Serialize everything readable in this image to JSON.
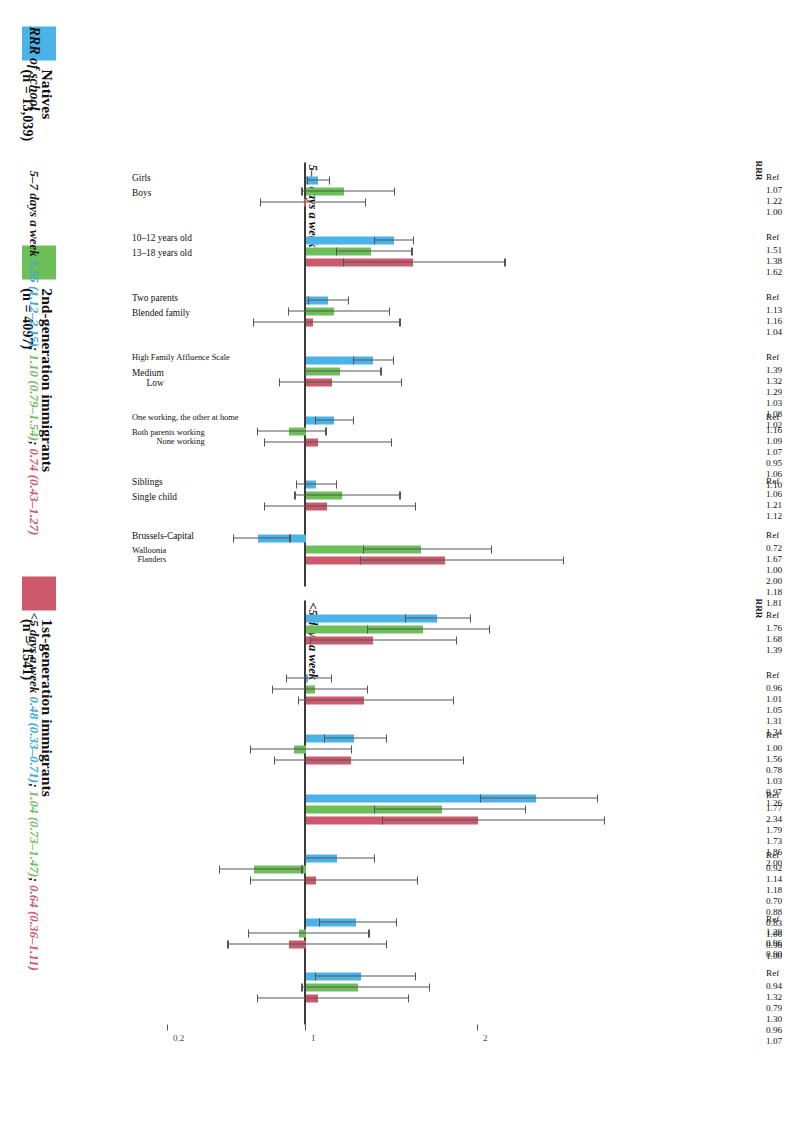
{
  "figure": {
    "caption_main": "RRR of school",
    "colors": {
      "natives": "#4cb3e8",
      "gen2": "#6cbf59",
      "gen1": "#cc5a6c",
      "axis": "#3b3b3b",
      "whisker": "#555555"
    }
  },
  "legend": {
    "items": [
      {
        "label": "Natives",
        "n": "(n = 13,039)",
        "color_key": "natives",
        "swatch": "#4cb3e8"
      },
      {
        "label": "2nd-generation immigrants",
        "n": "(n = 4097)",
        "color_key": "gen2",
        "swatch": "#6cbf59"
      },
      {
        "label": "1st-generation immigrants",
        "n": "(n = 1541)",
        "color_key": "gen1",
        "swatch": "#cc5a6c"
      }
    ]
  },
  "panels": [
    {
      "id": "A",
      "title": "5–7 days a week",
      "rrr_header": "RRR"
    },
    {
      "id": "B",
      "title": "<5 days a week",
      "rrr_header": "RRR"
    }
  ],
  "axis": {
    "ticks": [
      "0.2",
      "1",
      "2"
    ],
    "tick_values": [
      0.2,
      1,
      2
    ]
  },
  "categories": [
    {
      "label": "Girls",
      "group": "sex"
    },
    {
      "label": "Boys",
      "group": "sex"
    },
    {
      "label": "Boys",
      "group": "sex"
    },
    {
      "label": "Boys",
      "group": "sex"
    },
    {
      "label": "10–12 years old",
      "group": "age"
    },
    {
      "label": "13–18 years old",
      "group": "age"
    },
    {
      "label": "13–18 years old",
      "group": "age"
    },
    {
      "label": "13–18 years old",
      "group": "age"
    },
    {
      "label": "Two parents",
      "group": "family"
    },
    {
      "label": "Blended family\nSingle-parent family",
      "group": "family"
    },
    {
      "label": "Blended family\nSingle-parent family",
      "group": "family"
    },
    {
      "label": "Blended family\nSingle-parent family",
      "group": "family"
    },
    {
      "label": "High Family Affluence Scale",
      "group": "fas"
    },
    {
      "label": "Medium\nLow",
      "group": "fas"
    },
    {
      "label": "Medium\nLow",
      "group": "fas"
    },
    {
      "label": "Medium\nLow",
      "group": "fas"
    },
    {
      "label": "One working, the other at home",
      "group": "work"
    },
    {
      "label": "Both parents working\nOne working, the other not at home\nNone working",
      "group": "work"
    },
    {
      "label": "Both parents working\nOne working, the other not at home\nNone working",
      "group": "work"
    },
    {
      "label": "Both parents working\nOne working, the other not at home\nNone working",
      "group": "work"
    },
    {
      "label": "Siblings",
      "group": "sib"
    },
    {
      "label": "Single child",
      "group": "sib"
    },
    {
      "label": "Single child",
      "group": "sib"
    },
    {
      "label": "Single child",
      "group": "sib"
    },
    {
      "label": "Brussels-Capital",
      "group": "region"
    },
    {
      "label": "Walloonia\nFlanders",
      "group": "region"
    },
    {
      "label": "Walloonia\nFlanders",
      "group": "region"
    },
    {
      "label": "Walloonia\nFlanders",
      "group": "region"
    }
  ],
  "chart_data": {
    "type": "bar",
    "title": "RRR of school",
    "xlabel": "",
    "ylabel": "RRR",
    "ylim": [
      0.2,
      2.6
    ],
    "grid": false,
    "legend_position": "bottom-left",
    "reference_line": 1.0,
    "series_names": [
      "Natives",
      "2nd-generation immigrants",
      "1st-generation immigrants"
    ],
    "series_colors": [
      "#4cb3e8",
      "#6cbf59",
      "#cc5a6c"
    ],
    "panels": [
      {
        "name": "5–7 days a week",
        "groups": [
          {
            "name": "Sex",
            "reference": "Girls",
            "rows": [
              {
                "label": "Boys",
                "values": [
                  1.07,
                  1.22,
                  1.0
                ],
                "rrr_text": [
                  "Ref",
                  "1.07",
                  "1.22",
                  "1.00"
                ],
                "bars": [
                  {
                    "s": "natives",
                    "est": 1.07,
                    "lo": 1.01,
                    "hi": 1.14
                  },
                  {
                    "s": "gen2",
                    "est": 1.22,
                    "lo": 0.98,
                    "hi": 1.52
                  },
                  {
                    "s": "gen1",
                    "est": 1.0,
                    "lo": 0.74,
                    "hi": 1.35
                  }
                ]
              }
            ]
          },
          {
            "name": "Age",
            "reference": "10–12 years old",
            "rows": [
              {
                "label": "13–18 years old",
                "rrr_text": [
                  "Ref",
                  "1.51",
                  "1.38",
                  "1.62"
                ],
                "bars": [
                  {
                    "s": "natives",
                    "est": 1.51,
                    "lo": 1.4,
                    "hi": 1.63
                  },
                  {
                    "s": "gen2",
                    "est": 1.38,
                    "lo": 1.18,
                    "hi": 1.62
                  },
                  {
                    "s": "gen1",
                    "est": 1.62,
                    "lo": 1.22,
                    "hi": 2.16
                  }
                ]
              }
            ]
          },
          {
            "name": "Family structure",
            "reference": "Two parents",
            "rows": [
              {
                "label": "Blended family",
                "rrr_text": [
                  "Ref",
                  "1.13",
                  "1.16",
                  "1.04"
                ],
                "bars": [
                  {
                    "s": "natives",
                    "est": 1.13,
                    "lo": 1.02,
                    "hi": 1.25
                  },
                  {
                    "s": "gen2",
                    "est": 1.16,
                    "lo": 0.9,
                    "hi": 1.49
                  },
                  {
                    "s": "gen1",
                    "est": 1.04,
                    "lo": 0.7,
                    "hi": 1.55
                  }
                ]
              }
            ]
          },
          {
            "name": "Family Affluence Scale",
            "reference": "High Family Affluence Scale",
            "rows": [
              {
                "label": "Medium / Low",
                "rrr_text": [
                  "Ref",
                  "1.39",
                  "1.32",
                  "1.29",
                  "1.03",
                  "1.08",
                  "1.02"
                ],
                "bars": [
                  {
                    "s": "natives",
                    "est": 1.39,
                    "lo": 1.28,
                    "hi": 1.51
                  },
                  {
                    "s": "gen2",
                    "est": 1.2,
                    "lo": 1.0,
                    "hi": 1.44
                  },
                  {
                    "s": "gen1",
                    "est": 1.15,
                    "lo": 0.85,
                    "hi": 1.56
                  }
                ]
              }
            ]
          },
          {
            "name": "Parental work",
            "reference": "One working, the other at home",
            "rows": [
              {
                "label": "Both parents working / None working",
                "rrr_text": [
                  "Ref",
                  "1.16",
                  "1.09",
                  "1.07",
                  "0.95",
                  "1.06",
                  "1.10"
                ],
                "bars": [
                  {
                    "s": "natives",
                    "est": 1.16,
                    "lo": 1.06,
                    "hi": 1.28
                  },
                  {
                    "s": "gen2",
                    "est": 0.9,
                    "lo": 0.72,
                    "hi": 1.12
                  },
                  {
                    "s": "gen1",
                    "est": 1.07,
                    "lo": 0.76,
                    "hi": 1.5
                  }
                ]
              }
            ]
          },
          {
            "name": "Siblings",
            "reference": "Siblings",
            "rows": [
              {
                "label": "Single child",
                "rrr_text": [
                  "Ref",
                  "1.06",
                  "1.21",
                  "1.12"
                ],
                "bars": [
                  {
                    "s": "natives",
                    "est": 1.06,
                    "lo": 0.95,
                    "hi": 1.18
                  },
                  {
                    "s": "gen2",
                    "est": 1.21,
                    "lo": 0.94,
                    "hi": 1.55
                  },
                  {
                    "s": "gen1",
                    "est": 1.12,
                    "lo": 0.76,
                    "hi": 1.64
                  }
                ]
              }
            ]
          },
          {
            "name": "Region",
            "reference": "Brussels-Capital",
            "rows": [
              {
                "label": "Walloonia / Flanders",
                "rrr_text": [
                  "Ref",
                  "0.72",
                  "1.67",
                  "1.00",
                  "2.00",
                  "1.18",
                  "1.81"
                ],
                "bars": [
                  {
                    "s": "natives",
                    "est": 0.72,
                    "lo": 0.58,
                    "hi": 0.91
                  },
                  {
                    "s": "gen2",
                    "est": 1.67,
                    "lo": 1.34,
                    "hi": 2.08
                  },
                  {
                    "s": "gen1",
                    "est": 1.81,
                    "lo": 1.32,
                    "hi": 2.5
                  }
                ]
              }
            ]
          }
        ]
      },
      {
        "name": "<5 days a week",
        "groups": [
          {
            "name": "Sex",
            "reference": "Girls",
            "rows": [
              {
                "label": "Boys",
                "rrr_text": [
                  "Ref",
                  "1.76",
                  "1.68",
                  "1.39"
                ],
                "bars": [
                  {
                    "s": "natives",
                    "est": 1.76,
                    "lo": 1.58,
                    "hi": 1.96
                  },
                  {
                    "s": "gen2",
                    "est": 1.68,
                    "lo": 1.36,
                    "hi": 2.07
                  },
                  {
                    "s": "gen1",
                    "est": 1.39,
                    "lo": 1.03,
                    "hi": 1.88
                  }
                ]
              }
            ]
          },
          {
            "name": "Age",
            "reference": "10–12 years old",
            "rows": [
              {
                "label": "13–18 years old",
                "rrr_text": [
                  "Ref",
                  "0.96",
                  "1.01",
                  "1.05",
                  "1.31",
                  "1.34"
                ],
                "bars": [
                  {
                    "s": "natives",
                    "est": 1.01,
                    "lo": 0.89,
                    "hi": 1.15
                  },
                  {
                    "s": "gen2",
                    "est": 1.05,
                    "lo": 0.81,
                    "hi": 1.36
                  },
                  {
                    "s": "gen1",
                    "est": 1.34,
                    "lo": 0.96,
                    "hi": 1.86
                  }
                ]
              }
            ]
          },
          {
            "name": "Family structure",
            "reference": "Two parents",
            "rows": [
              {
                "label": "Blended family",
                "rrr_text": [
                  "Ref",
                  "1.00",
                  "1.56",
                  "0.78",
                  "1.03",
                  "0.97",
                  "1.26"
                ],
                "bars": [
                  {
                    "s": "natives",
                    "est": 1.28,
                    "lo": 1.11,
                    "hi": 1.47
                  },
                  {
                    "s": "gen2",
                    "est": 0.93,
                    "lo": 0.68,
                    "hi": 1.27
                  },
                  {
                    "s": "gen1",
                    "est": 1.26,
                    "lo": 0.82,
                    "hi": 1.92
                  }
                ]
              }
            ]
          },
          {
            "name": "Family Affluence Scale",
            "reference": "High Family Affluence Scale",
            "rows": [
              {
                "label": "Medium / Low",
                "rrr_text": [
                  "Ref",
                  "1.77",
                  "2.34",
                  "1.79",
                  "1.73",
                  "1.86",
                  "2.00"
                ],
                "bars": [
                  {
                    "s": "natives",
                    "est": 2.34,
                    "lo": 2.02,
                    "hi": 2.7
                  },
                  {
                    "s": "gen2",
                    "est": 1.79,
                    "lo": 1.4,
                    "hi": 2.28
                  },
                  {
                    "s": "gen1",
                    "est": 2.0,
                    "lo": 1.45,
                    "hi": 2.74
                  }
                ]
              }
            ]
          },
          {
            "name": "Parental work",
            "reference": "One working, the other at home",
            "rows": [
              {
                "label": "Both parents working / None working",
                "rrr_text": [
                  "Ref",
                  "0.92",
                  "1.14",
                  "1.18",
                  "0.70",
                  "0.88",
                  "0.83",
                  "1.06",
                  "0.96",
                  "1.00"
                ],
                "bars": [
                  {
                    "s": "natives",
                    "est": 1.18,
                    "lo": 1.0,
                    "hi": 1.4
                  },
                  {
                    "s": "gen2",
                    "est": 0.7,
                    "lo": 0.5,
                    "hi": 0.98
                  },
                  {
                    "s": "gen1",
                    "est": 1.06,
                    "lo": 0.68,
                    "hi": 1.65
                  }
                ]
              }
            ]
          },
          {
            "name": "Siblings",
            "reference": "Siblings",
            "rows": [
              {
                "label": "Single child",
                "rrr_text": [
                  "Ref",
                  "1.29",
                  "0.96",
                  "0.90"
                ],
                "bars": [
                  {
                    "s": "natives",
                    "est": 1.29,
                    "lo": 1.08,
                    "hi": 1.53
                  },
                  {
                    "s": "gen2",
                    "est": 0.96,
                    "lo": 0.67,
                    "hi": 1.37
                  },
                  {
                    "s": "gen1",
                    "est": 0.9,
                    "lo": 0.55,
                    "hi": 1.47
                  }
                ]
              }
            ]
          },
          {
            "name": "Region",
            "reference": "Brussels-Capital",
            "rows": [
              {
                "label": "Walloonia / Flanders",
                "rrr_text": [
                  "Ref",
                  "0.94",
                  "1.32",
                  "0.79",
                  "1.30",
                  "0.96",
                  "1.07"
                ],
                "bars": [
                  {
                    "s": "natives",
                    "est": 1.32,
                    "lo": 1.06,
                    "hi": 1.64
                  },
                  {
                    "s": "gen2",
                    "est": 1.3,
                    "lo": 0.98,
                    "hi": 1.72
                  },
                  {
                    "s": "gen1",
                    "est": 1.07,
                    "lo": 0.72,
                    "hi": 1.6
                  }
                ]
              }
            ]
          }
        ]
      }
    ]
  },
  "caption": {
    "main": "RRR of school",
    "lines": [
      {
        "label": "5–7 days a week",
        "natives": "1.55 (1.12–2.15)",
        "gen2": "1.10 (0.79–1.54)",
        "gen1": "0.74 (0.43–1.27)"
      },
      {
        "label": "<5 days a week",
        "natives": "0.48 (0.33–0.71)",
        "gen2": "1.04 (0.73–1.47)",
        "gen1": "0.64 (0.36–1.11)"
      }
    ]
  }
}
